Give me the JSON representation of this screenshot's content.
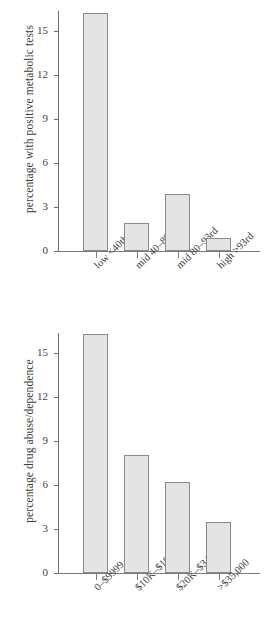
{
  "chart_data": [
    {
      "type": "bar",
      "title": "",
      "xlabel": "",
      "ylabel": "percentage with positive metabolic tests",
      "categories": [
        "low <40th",
        "mid 40–80th",
        "mid 80–93rd",
        "high >93rd"
      ],
      "values": [
        16.2,
        1.9,
        3.9,
        0.9
      ],
      "yticks": [
        "0",
        "3",
        "6",
        "9",
        "12",
        "15"
      ],
      "ytick_values": [
        0,
        3,
        6,
        9,
        12,
        15
      ],
      "ylim": [
        0,
        16.5
      ],
      "grid": false,
      "legend": "none",
      "bar_fill": "#e4e4e4",
      "bar_edge": "#8a8a8a"
    },
    {
      "type": "bar",
      "title": "",
      "xlabel": "",
      "ylabel": "percentage drug abuse/dependence",
      "categories": [
        "0–$9999",
        "$10K–$19,999",
        "$20K–$34,999",
        ">$35,000"
      ],
      "values": [
        16.3,
        8.05,
        6.2,
        3.45
      ],
      "yticks": [
        "0",
        "3",
        "6",
        "9",
        "12",
        "15"
      ],
      "ytick_values": [
        0,
        3,
        6,
        9,
        12,
        15
      ],
      "ylim": [
        0,
        16.5
      ],
      "grid": false,
      "legend": "none",
      "bar_fill": "#e4e4e4",
      "bar_edge": "#8a8a8a"
    }
  ]
}
